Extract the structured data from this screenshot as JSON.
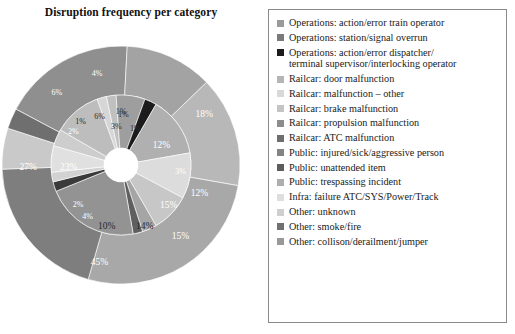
{
  "chart": {
    "title": "Disruption frequency per category"
  },
  "legend": {
    "items": [
      {
        "label": "Operations: action/error train operator",
        "color": "#9a9a9a"
      },
      {
        "label": "Operations: station/signal overrun",
        "color": "#7a7a7a"
      },
      {
        "label": "Operations: action/error dispatcher/\nterminal supervisor/interlocking operator",
        "color": "#1c1c1c"
      },
      {
        "label": "Railcar: door malfunction",
        "color": "#b5b5b5"
      },
      {
        "label": "Railcar: malfunction – other",
        "color": "#d8d8d8"
      },
      {
        "label": "Railcar: brake malfunction",
        "color": "#c4c4c4"
      },
      {
        "label": "Railcar: propulsion malfunction",
        "color": "#8c8c8c"
      },
      {
        "label": "Railcar: ATC malfunction",
        "color": "#6e6e6e"
      },
      {
        "label": "Public: injured/sick/aggressive person",
        "color": "#848484"
      },
      {
        "label": "Public: unattended item",
        "color": "#5c5c5c"
      },
      {
        "label": "Public: trespassing incident",
        "color": "#aeaeae"
      },
      {
        "label": "Infra: failure ATC/SYS/Power/Track",
        "color": "#dedede"
      },
      {
        "label": "Other: unknown",
        "color": "#cfcfcf"
      },
      {
        "label": "Other: smoke/fire",
        "color": "#707070"
      },
      {
        "label": "Other: collison/derailment/jumper",
        "color": "#999999"
      }
    ]
  },
  "chart_data": {
    "type": "pie",
    "title": "Disruption frequency per category",
    "subtype": "nested-donut",
    "rings": [
      {
        "name": "outer",
        "categories": [
          "Operations: action/error train operator",
          "Railcar: door malfunction",
          "Railcar: brake malfunction",
          "Public: injured/sick/aggressive person",
          "Other: collison/derailment/jumper",
          "Infra: failure ATC/SYS/Power/Track",
          "Operations: station/signal overrun"
        ],
        "values": [
          18,
          45,
          14,
          27,
          6,
          4,
          12
        ],
        "labels": [
          "18%",
          "45%",
          "14%",
          "27%",
          "6%",
          "4%",
          "12%"
        ]
      },
      {
        "name": "inner",
        "categories": [
          "Railcar: ATC malfunction",
          "Public: unattended item",
          "Railcar: propulsion malfunction",
          "Other: unknown",
          "Public: trespassing incident",
          "Operations: action/error dispatcher/terminal supervisor/interlocking operator",
          "Other: smoke/fire",
          "Railcar: malfunction – other"
        ],
        "values": [
          15,
          3,
          10,
          23,
          4,
          2,
          6,
          1
        ],
        "labels": [
          "15%",
          "3%",
          "10%",
          "23%",
          "4%",
          "2%",
          "6%",
          "1%",
          "1%",
          "3%",
          "2%"
        ]
      }
    ],
    "all_data_labels": [
      "18%",
      "45%",
      "14%",
      "10%",
      "4%",
      "2%",
      "23%",
      "27%",
      "6%",
      "4%",
      "1%",
      "6%",
      "1%",
      "3%",
      "12%",
      "15%",
      "3%",
      "2%"
    ],
    "legend_position": "right",
    "grid": false,
    "colorscale": "grayscale"
  },
  "slices": {
    "outer": [
      {
        "label": "18%",
        "start": -62,
        "end": 3,
        "color": "#8f8f8f",
        "lx": 0.7,
        "ly": -0.42,
        "text": "light"
      },
      {
        "label": "12%",
        "start": 3,
        "end": 46,
        "color": "#a3a3a3",
        "lx": 0.66,
        "ly": 0.24,
        "text": "light"
      },
      {
        "label": "15%",
        "start": 46,
        "end": 100,
        "color": "#b8b8b8",
        "lx": 0.5,
        "ly": 0.6,
        "text": "light"
      },
      {
        "label": "45%",
        "start": 100,
        "end": 196,
        "color": "#a8a8a8",
        "lx": -0.18,
        "ly": 0.82,
        "text": "light"
      },
      {
        "label": "27%",
        "start": 196,
        "end": 268,
        "color": "#7e7e7e",
        "lx": -0.78,
        "ly": 0.02,
        "text": "light"
      },
      {
        "label": "6%",
        "start": 268,
        "end": 288,
        "color": "#c9c9c9",
        "lx": -0.54,
        "ly": -0.6,
        "text": "light"
      },
      {
        "label": "4%",
        "start": 288,
        "end": 298,
        "color": "#6f6f6f",
        "lx": -0.2,
        "ly": -0.76,
        "text": "light"
      }
    ],
    "inner": [
      {
        "label": "1%",
        "start": -20,
        "end": -12,
        "color": "#d6d6d6",
        "lx": 0.02,
        "ly": -0.42,
        "text": "dark"
      },
      {
        "label": "1%",
        "start": -12,
        "end": -4,
        "color": "#c0c0c0",
        "lx": 0.12,
        "ly": -0.3,
        "text": "dark"
      },
      {
        "label": "12%",
        "start": -4,
        "end": 20,
        "color": "#9e9e9e",
        "lx": 0.34,
        "ly": -0.16,
        "text": "light"
      },
      {
        "label": "3%",
        "start": 20,
        "end": 30,
        "color": "#1c1c1c",
        "lx": 0.5,
        "ly": 0.06,
        "text": "light"
      },
      {
        "label": "15%",
        "start": 30,
        "end": 80,
        "color": "#b0b0b0",
        "lx": 0.4,
        "ly": 0.34,
        "text": "light"
      },
      {
        "label": "14%",
        "start": 80,
        "end": 118,
        "color": "#dcdcdc",
        "lx": 0.2,
        "ly": 0.52,
        "text": "dark"
      },
      {
        "label": "10%",
        "start": 118,
        "end": 150,
        "color": "#c7c7c7",
        "lx": -0.12,
        "ly": 0.52,
        "text": "dark"
      },
      {
        "label": "4%",
        "start": 150,
        "end": 162,
        "color": "#a5a5a5",
        "lx": -0.28,
        "ly": 0.44,
        "text": "light"
      },
      {
        "label": "2%",
        "start": 162,
        "end": 170,
        "color": "#5f5f5f",
        "lx": -0.36,
        "ly": 0.34,
        "text": "light"
      },
      {
        "label": "23%",
        "start": 170,
        "end": 248,
        "color": "#939393",
        "lx": -0.44,
        "ly": 0.02,
        "text": "light"
      },
      {
        "label": "2%",
        "start": 248,
        "end": 256,
        "color": "#3a3a3a",
        "lx": -0.4,
        "ly": -0.28,
        "text": "light"
      },
      {
        "label": "1%",
        "start": 256,
        "end": 264,
        "color": "#d2d2d2",
        "lx": -0.34,
        "ly": -0.36,
        "text": "dark"
      },
      {
        "label": "6%",
        "start": 264,
        "end": 286,
        "color": "#e0e0e0",
        "lx": -0.18,
        "ly": -0.4,
        "text": "dark"
      },
      {
        "label": "3%",
        "start": 286,
        "end": 300,
        "color": "#cdcdcd",
        "lx": -0.04,
        "ly": -0.32,
        "text": "dark"
      },
      {
        "label": "1%",
        "start": 300,
        "end": 340,
        "color": "#bdbdbd",
        "lx": 0.0,
        "ly": -0.44,
        "text": "dark"
      }
    ]
  }
}
